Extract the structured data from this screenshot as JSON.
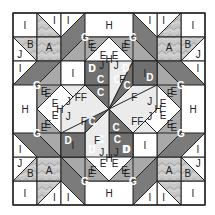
{
  "grid": {
    "origin": 13,
    "cell": 24,
    "size": 8
  },
  "colors": {
    "white": "#ffffff",
    "A": "#c4c4c4",
    "B": "#c4c4c4",
    "C": "#707070",
    "D": "#707070",
    "E": "#a9a9a9",
    "F": "#ebebeb",
    "G": "#7b7b7b",
    "H": "#ffffff",
    "I": "#ffffff",
    "J": "#ffffff",
    "stroke": "#222222",
    "darkText": "#222222",
    "lightText": "#ffffff"
  },
  "legend_letters": [
    "A",
    "B",
    "C",
    "D",
    "E",
    "F",
    "G",
    "H",
    "I",
    "J"
  ],
  "pieces": [
    {
      "id": "tl-I-sq",
      "label": "I",
      "fill": "I",
      "pts": [
        [
          0,
          0
        ],
        [
          1,
          0
        ],
        [
          1,
          1
        ],
        [
          0,
          1
        ]
      ],
      "lx": 0.5,
      "ly": 0.5
    },
    {
      "id": "tl-I-tri",
      "label": "I",
      "fill": "I",
      "pts": [
        [
          1,
          0
        ],
        [
          2,
          0
        ],
        [
          2,
          1
        ]
      ],
      "lx": 1.7,
      "ly": 0.35
    },
    {
      "id": "tl-A-tri",
      "label": "",
      "fill": "A",
      "pts": [
        [
          1,
          0
        ],
        [
          2,
          1
        ],
        [
          1,
          1
        ]
      ],
      "lx": 1.3,
      "ly": 0.7
    },
    {
      "id": "tl-J",
      "label": "J",
      "fill": "J",
      "pts": [
        [
          0,
          1
        ],
        [
          1,
          2
        ],
        [
          0,
          2
        ]
      ],
      "lx": 0.3,
      "ly": 1.7
    },
    {
      "id": "tl-B",
      "label": "B",
      "fill": "B",
      "pts": [
        [
          0,
          1
        ],
        [
          1,
          1
        ],
        [
          1,
          2
        ]
      ],
      "lx": 0.7,
      "ly": 1.3
    },
    {
      "id": "tl-A",
      "label": "A",
      "fill": "A",
      "pts": [
        [
          1,
          1
        ],
        [
          2,
          1
        ],
        [
          2,
          2
        ],
        [
          1,
          2
        ]
      ],
      "lx": 1.45,
      "ly": 1.3
    },
    {
      "id": "tr-I-sq",
      "label": "I",
      "fill": "I",
      "pts": [
        [
          7,
          0
        ],
        [
          8,
          0
        ],
        [
          8,
          1
        ],
        [
          7,
          1
        ]
      ],
      "lx": 7.5,
      "ly": 0.5
    },
    {
      "id": "tr-J",
      "label": "J",
      "fill": "J",
      "pts": [
        [
          6,
          0
        ],
        [
          7,
          0
        ],
        [
          6,
          1
        ]
      ],
      "lx": 6.3,
      "ly": 0.3
    },
    {
      "id": "tr-B",
      "label": "B",
      "fill": "B",
      "pts": [
        [
          7,
          0
        ],
        [
          7,
          1
        ],
        [
          6,
          1
        ]
      ],
      "lx": 6.7,
      "ly": 0.7
    },
    {
      "id": "tr-A",
      "label": "A",
      "fill": "A",
      "pts": [
        [
          6,
          1
        ],
        [
          7,
          1
        ],
        [
          7,
          2
        ],
        [
          6,
          2
        ]
      ],
      "lx": 6.55,
      "ly": 1.45
    },
    {
      "id": "tr-A-tri",
      "label": "",
      "fill": "A",
      "pts": [
        [
          7,
          1
        ],
        [
          8,
          2
        ],
        [
          7,
          2
        ]
      ],
      "lx": 7.3,
      "ly": 1.7
    },
    {
      "id": "tr-I-tri",
      "label": "I",
      "fill": "I",
      "pts": [
        [
          7,
          1
        ],
        [
          8,
          1
        ],
        [
          8,
          2
        ]
      ],
      "lx": 7.7,
      "ly": 1.35
    },
    {
      "id": "bl-I-sq",
      "label": "I",
      "fill": "I",
      "pts": [
        [
          0,
          7
        ],
        [
          1,
          7
        ],
        [
          1,
          8
        ],
        [
          0,
          8
        ]
      ],
      "lx": 0.5,
      "ly": 7.5
    },
    {
      "id": "bl-I-tri",
      "label": "I",
      "fill": "I",
      "pts": [
        [
          0,
          6
        ],
        [
          1,
          6
        ],
        [
          0,
          7
        ]
      ],
      "lx": 0.3,
      "ly": 6.35
    },
    {
      "id": "bl-A-tri",
      "label": "",
      "fill": "A",
      "pts": [
        [
          1,
          6
        ],
        [
          1,
          7
        ],
        [
          0,
          7
        ]
      ],
      "lx": 0.7,
      "ly": 6.7
    },
    {
      "id": "bl-A",
      "label": "A",
      "fill": "A",
      "pts": [
        [
          1,
          6
        ],
        [
          2,
          6
        ],
        [
          2,
          7
        ],
        [
          1,
          7
        ]
      ],
      "lx": 1.45,
      "ly": 6.55
    },
    {
      "id": "bl-B",
      "label": "B",
      "fill": "B",
      "pts": [
        [
          1,
          7
        ],
        [
          2,
          7
        ],
        [
          1,
          8
        ]
      ],
      "lx": 1.3,
      "ly": 7.3
    },
    {
      "id": "bl-J",
      "label": "J",
      "fill": "J",
      "pts": [
        [
          2,
          7
        ],
        [
          2,
          8
        ],
        [
          1,
          8
        ]
      ],
      "lx": 1.7,
      "ly": 7.7
    },
    {
      "id": "br-I-sq",
      "label": "I",
      "fill": "I",
      "pts": [
        [
          7,
          7
        ],
        [
          8,
          7
        ],
        [
          8,
          8
        ],
        [
          7,
          8
        ]
      ],
      "lx": 7.5,
      "ly": 7.5
    },
    {
      "id": "br-A",
      "label": "A",
      "fill": "A",
      "pts": [
        [
          6,
          6
        ],
        [
          7,
          6
        ],
        [
          7,
          7
        ],
        [
          6,
          7
        ]
      ],
      "lx": 6.5,
      "ly": 6.45
    },
    {
      "id": "br-A-tri",
      "label": "",
      "fill": "A",
      "pts": [
        [
          6,
          7
        ],
        [
          7,
          7
        ],
        [
          7,
          8
        ]
      ],
      "lx": 6.7,
      "ly": 7.3
    },
    {
      "id": "br-I-tri",
      "label": "I",
      "fill": "I",
      "pts": [
        [
          6,
          7
        ],
        [
          7,
          8
        ],
        [
          6,
          8
        ]
      ],
      "lx": 6.3,
      "ly": 7.65
    },
    {
      "id": "br-B",
      "label": "B",
      "fill": "B",
      "pts": [
        [
          7,
          6
        ],
        [
          8,
          7
        ],
        [
          7,
          7
        ]
      ],
      "lx": 7.3,
      "ly": 6.7
    },
    {
      "id": "br-J",
      "label": "J",
      "fill": "J",
      "pts": [
        [
          7,
          6
        ],
        [
          8,
          6
        ],
        [
          8,
          7
        ]
      ],
      "lx": 7.7,
      "ly": 6.3
    },
    {
      "id": "t-I-1",
      "label": "I",
      "fill": "I",
      "pts": [
        [
          2,
          0
        ],
        [
          3,
          0
        ],
        [
          2,
          1
        ]
      ],
      "lx": 2.35,
      "ly": 0.35
    },
    {
      "id": "t-G",
      "label": "G",
      "fill": "G",
      "pts": [
        [
          3,
          0
        ],
        [
          4,
          0
        ],
        [
          2,
          2
        ],
        [
          2,
          1
        ]
      ],
      "lx": 3.1,
      "ly": 0.95,
      "light": true
    },
    {
      "id": "t-E-1",
      "label": "E",
      "fill": "E",
      "pts": [
        [
          4,
          0
        ],
        [
          4,
          1
        ],
        [
          3,
          2
        ],
        [
          2,
          2
        ]
      ],
      "lx": 3.55,
      "ly": 1.15
    },
    {
      "id": "t-E-2",
      "label": "E",
      "fill": "E",
      "pts": [
        [
          4,
          1
        ],
        [
          4,
          2
        ],
        [
          3,
          2
        ]
      ],
      "lx": 3.7,
      "ly": 1.7
    },
    {
      "id": "l-I",
      "label": "I",
      "fill": "I",
      "pts": [
        [
          0,
          2
        ],
        [
          1,
          2
        ],
        [
          0,
          3
        ]
      ],
      "lx": 0.3,
      "ly": 2.35
    },
    {
      "id": "l-G",
      "label": "G",
      "fill": "G",
      "pts": [
        [
          1,
          2
        ],
        [
          2,
          2
        ],
        [
          0,
          4
        ],
        [
          0,
          3
        ]
      ],
      "lx": 0.9,
      "ly": 3.1,
      "light": true
    },
    {
      "id": "l-E",
      "label": "E",
      "fill": "E",
      "pts": [
        [
          2,
          2
        ],
        [
          2,
          3
        ],
        [
          1,
          4
        ],
        [
          0,
          4
        ]
      ],
      "lx": 1.35,
      "ly": 3.4
    },
    {
      "id": "l-E2",
      "label": "E",
      "fill": "E",
      "pts": [
        [
          2,
          3
        ],
        [
          2,
          4
        ],
        [
          1,
          4
        ]
      ],
      "lx": 1.75,
      "ly": 3.7
    },
    {
      "id": "t-H-rect",
      "label": "H",
      "fill": "H",
      "pts": [
        [
          4,
          0
        ],
        [
          5,
          0
        ],
        [
          5,
          1
        ],
        [
          4,
          1
        ]
      ],
      "lx": 4.5,
      "ly": 0.5
    },
    {
      "id": "tr-G",
      "label": "G",
      "fill": "G",
      "pts": [
        [
          5,
          0
        ],
        [
          6,
          0
        ],
        [
          6,
          1
        ],
        [
          5,
          1
        ]
      ],
      "lx": 5.5,
      "ly": 0.6,
      "light": true
    }
  ]
}
